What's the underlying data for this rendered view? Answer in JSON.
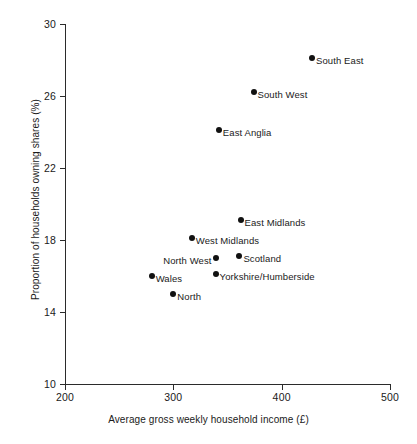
{
  "chart_data": {
    "type": "scatter",
    "title": "",
    "xlabel": "Average gross weekly household income (£)",
    "ylabel": "Proportion of households owning shares (%)",
    "xlim": [
      200,
      500
    ],
    "ylim": [
      10,
      30
    ],
    "xticks": [
      "200",
      "300",
      "400",
      "500"
    ],
    "yticks": [
      "30",
      "26",
      "22",
      "18",
      "14",
      "10"
    ],
    "grid": false,
    "legend": "none",
    "points": [
      {
        "label": "South East",
        "x": 428,
        "y": 28.1,
        "label_side": "right"
      },
      {
        "label": "South West",
        "x": 374,
        "y": 26.2,
        "label_side": "right"
      },
      {
        "label": "East Anglia",
        "x": 342,
        "y": 24.1,
        "label_side": "right"
      },
      {
        "label": "East Midlands",
        "x": 362,
        "y": 19.1,
        "label_side": "right"
      },
      {
        "label": "West Midlands",
        "x": 317,
        "y": 18.1,
        "label_side": "right"
      },
      {
        "label": "North West",
        "x": 339,
        "y": 17.0,
        "label_side": "left"
      },
      {
        "label": "Scotland",
        "x": 361,
        "y": 17.1,
        "label_side": "right"
      },
      {
        "label": "Wales",
        "x": 280,
        "y": 16.0,
        "label_side": "right"
      },
      {
        "label": "Yorkshire/Humberside",
        "x": 339,
        "y": 16.1,
        "label_side": "right"
      },
      {
        "label": "North",
        "x": 300,
        "y": 15.0,
        "label_side": "right"
      }
    ]
  },
  "colors": {
    "marker": "#111111",
    "axis": "#2b2b2b",
    "background": "#ffffff",
    "text": "#1a1a1a"
  }
}
